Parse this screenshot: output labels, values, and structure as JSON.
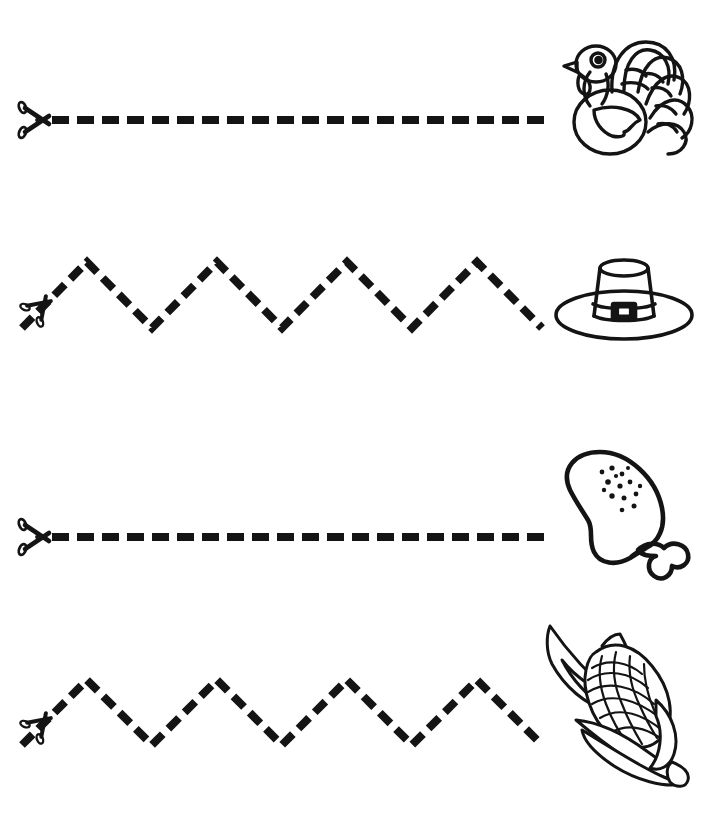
{
  "page": {
    "background_color": "#ffffff",
    "ink_color": "#141414",
    "width": 728,
    "height": 819
  },
  "worksheet": {
    "start_marker_icon": "scissors-icon",
    "rows": [
      {
        "index": 1,
        "line_type": "straight-dashed",
        "line_label": "straight dashed cutting line",
        "start_marker": "scissors-icon",
        "picture_name": "turkey-illustration",
        "picture_label": "Turkey",
        "path": {
          "x1": 52,
          "y1": 120,
          "x2": 542,
          "y2": 120
        },
        "dash_length": 17,
        "dash_gap": 8,
        "stroke_width": 8,
        "scissors": {
          "x": 38,
          "y": 120
        },
        "picture_box": {
          "x": 550,
          "y": 26,
          "w": 148,
          "h": 140
        }
      },
      {
        "index": 2,
        "line_type": "zigzag-dashed",
        "line_label": "zigzag dashed cutting line",
        "start_marker": "scissors-icon",
        "picture_name": "pilgrim-hat-illustration",
        "picture_label": "Pilgrim Hat",
        "zigzag": {
          "x_start": 22,
          "x_end": 542,
          "y_top": 262,
          "y_bottom": 325,
          "peaks": 4
        },
        "dash_length": 15,
        "dash_gap": 8,
        "stroke_width": 8,
        "scissors": {
          "x": 42,
          "y": 302
        },
        "picture_box": {
          "x": 550,
          "y": 250,
          "w": 148,
          "h": 92
        }
      },
      {
        "index": 3,
        "line_type": "straight-dashed",
        "line_label": "straight dashed cutting line",
        "start_marker": "scissors-icon",
        "picture_name": "drumstick-illustration",
        "picture_label": "Turkey Leg",
        "path": {
          "x1": 52,
          "y1": 537,
          "x2": 542,
          "y2": 537
        },
        "dash_length": 17,
        "dash_gap": 8,
        "stroke_width": 8,
        "scissors": {
          "x": 38,
          "y": 537
        },
        "picture_box": {
          "x": 550,
          "y": 446,
          "w": 148,
          "h": 136
        }
      },
      {
        "index": 4,
        "line_type": "zigzag-dashed",
        "line_label": "zigzag dashed cutting line",
        "start_marker": "scissors-icon",
        "picture_name": "corn-illustration",
        "picture_label": "Corn on the Cob",
        "zigzag": {
          "x_start": 22,
          "x_end": 542,
          "y_top": 682,
          "y_bottom": 745,
          "peaks": 4
        },
        "dash_length": 15,
        "dash_gap": 8,
        "stroke_width": 8,
        "scissors": {
          "x": 42,
          "y": 722
        },
        "picture_box": {
          "x": 524,
          "y": 612,
          "w": 178,
          "h": 176
        }
      }
    ]
  }
}
